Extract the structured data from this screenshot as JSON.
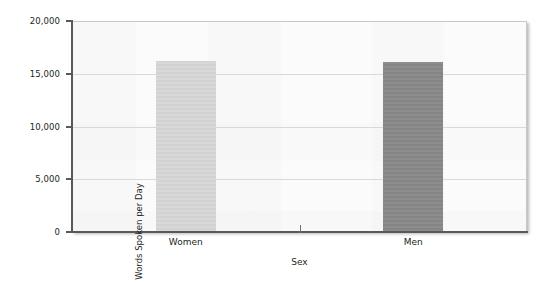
{
  "chart_data": {
    "type": "bar",
    "title": "",
    "categories": [
      "Women",
      "Men"
    ],
    "values": [
      16200,
      16100
    ],
    "series": [
      {
        "name": "Words Spoken per Day",
        "values": [
          16200,
          16100
        ]
      }
    ],
    "xlabel": "Sex",
    "ylabel": "Words Spoken per Day",
    "ylim": [
      0,
      20000
    ],
    "ytick_values": [
      20000,
      15000,
      10000,
      5000,
      0
    ],
    "ytick_labels": [
      "20,000",
      "15,000",
      "10,000",
      "5,000",
      "0"
    ],
    "grid": "horizontal",
    "legend": "none",
    "bar_colors": [
      "#d6d6d6",
      "#878787"
    ],
    "plot_background": "#fbfbfb",
    "axis_color": "#58595b",
    "gridline_color": "#d9d9d9"
  },
  "axes": {
    "y_title": "Words Spoken per Day",
    "x_title": "Sex"
  },
  "ticks": {
    "y": [
      {
        "label": "20,000",
        "value": 20000
      },
      {
        "label": "15,000",
        "value": 15000
      },
      {
        "label": "10,000",
        "value": 10000
      },
      {
        "label": "5,000",
        "value": 5000
      },
      {
        "label": "0",
        "value": 0
      }
    ],
    "x": [
      {
        "label": "Women"
      },
      {
        "label": "Men"
      }
    ]
  },
  "bars": [
    {
      "category": "Women",
      "value": 16200,
      "color": "#d6d6d6"
    },
    {
      "category": "Men",
      "value": 16100,
      "color": "#878787"
    }
  ]
}
